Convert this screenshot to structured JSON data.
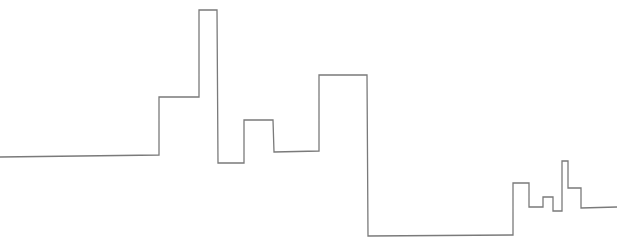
{
  "drawing": {
    "description": "single continuous stepped line (city skyline-like)",
    "stroke_color": "#7a7a7a",
    "background_color": "#ffffff",
    "stroke_width": 1.3,
    "points": [
      [
        0,
        157
      ],
      [
        159,
        155
      ],
      [
        159,
        97
      ],
      [
        199,
        97
      ],
      [
        199,
        10
      ],
      [
        217,
        10
      ],
      [
        218,
        163
      ],
      [
        244,
        163
      ],
      [
        244,
        120
      ],
      [
        273,
        120
      ],
      [
        274,
        152
      ],
      [
        319,
        151
      ],
      [
        319,
        75
      ],
      [
        367,
        75
      ],
      [
        368,
        236
      ],
      [
        513,
        235
      ],
      [
        513,
        183
      ],
      [
        529,
        183
      ],
      [
        529,
        207
      ],
      [
        543,
        207
      ],
      [
        543,
        197
      ],
      [
        553,
        197
      ],
      [
        553,
        211
      ],
      [
        562,
        211
      ],
      [
        562,
        161
      ],
      [
        568,
        161
      ],
      [
        568,
        188
      ],
      [
        581,
        188
      ],
      [
        581,
        208
      ],
      [
        617,
        207
      ]
    ]
  }
}
